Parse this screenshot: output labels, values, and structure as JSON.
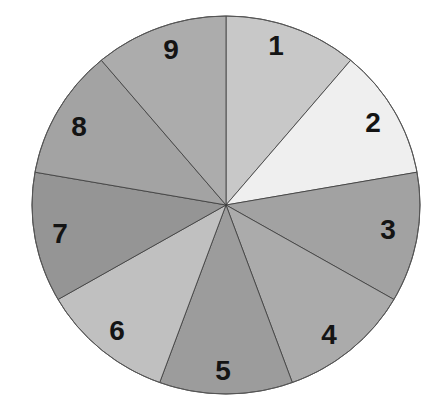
{
  "chart_data": {
    "type": "pie",
    "title": "",
    "categories": [
      "1",
      "2",
      "3",
      "4",
      "5",
      "6",
      "7",
      "8",
      "9"
    ],
    "values": [
      1,
      1,
      1,
      1,
      1,
      1,
      1,
      1,
      1
    ],
    "percentages": [
      11.1,
      11.1,
      11.1,
      11.1,
      11.1,
      11.1,
      11.1,
      11.1,
      11.1
    ],
    "start_angle_deg": 0,
    "direction": "clockwise",
    "legend": "none",
    "slices": [
      {
        "label": "1",
        "color": "#c8c8c8"
      },
      {
        "label": "2",
        "color": "#efefef"
      },
      {
        "label": "3",
        "color": "#a2a2a2"
      },
      {
        "label": "4",
        "color": "#ababab"
      },
      {
        "label": "5",
        "color": "#9c9c9c"
      },
      {
        "label": "6",
        "color": "#c0c0c0"
      },
      {
        "label": "7",
        "color": "#959595"
      },
      {
        "label": "8",
        "color": "#a3a3a3"
      },
      {
        "label": "9",
        "color": "#acacac"
      }
    ]
  },
  "geometry": {
    "cx": 226,
    "cy": 205,
    "rx": 194,
    "ry": 189,
    "label_positions": [
      [
        276,
        45
      ],
      [
        373,
        122
      ],
      [
        388,
        229
      ],
      [
        329,
        334
      ],
      [
        223,
        370
      ],
      [
        117,
        330
      ],
      [
        60,
        233
      ],
      [
        79,
        126
      ],
      [
        171,
        49
      ]
    ]
  }
}
